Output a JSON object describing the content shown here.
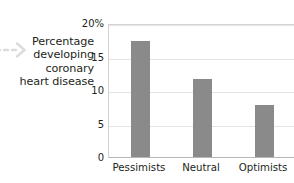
{
  "chart_data": {
    "type": "bar",
    "title": "",
    "subtitle": "",
    "categories": [
      "Pessimists",
      "Neutral",
      "Optimists"
    ],
    "values": [
      17.3,
      11.7,
      7.8
    ],
    "series": [
      {
        "name": "Percentage developing coronary heart disease",
        "values": [
          17.3,
          11.7,
          7.8
        ]
      }
    ],
    "xlabel": "",
    "ylabel": "Percentage developing coronary heart disease",
    "ylim": [
      0,
      20
    ],
    "yticks": [
      0,
      5,
      10,
      15,
      20
    ],
    "ytick_labels": [
      "0",
      "5",
      "10",
      "15",
      "20%"
    ],
    "grid": true,
    "legend": false,
    "bar_color": "#8a8a8a",
    "gridline_color": "#e3e4e6",
    "axis_color": "#b5b6b8"
  },
  "annotation": {
    "arrow_name": "dashed-arrow-pointer",
    "caption_lines": [
      "Percentage",
      "developing",
      "coronary",
      "heart disease"
    ]
  },
  "axis": {
    "y_labels": [
      {
        "text": "20%",
        "value": 20
      },
      {
        "text": "15",
        "value": 15
      },
      {
        "text": "10",
        "value": 10
      },
      {
        "text": "5",
        "value": 5
      },
      {
        "text": "0",
        "value": 0
      }
    ],
    "x_labels": [
      "Pessimists",
      "Neutral",
      "Optimists"
    ]
  }
}
